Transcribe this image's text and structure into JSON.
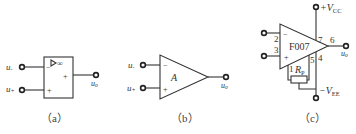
{
  "figure": {
    "panels": [
      {
        "id": "a",
        "caption": "（a）",
        "symbol": "rectangular-op-amp",
        "gain_mark": "▷∞",
        "inputs": [
          {
            "label": "u",
            "sub": "-",
            "sign": "−"
          },
          {
            "label": "u",
            "sub": "+",
            "sign": "+"
          }
        ],
        "output": {
          "label": "u",
          "sub": "o",
          "sign": "+"
        }
      },
      {
        "id": "b",
        "caption": "（b）",
        "symbol": "triangle-op-amp",
        "gain_label": "A",
        "inputs": [
          {
            "label": "u",
            "sub": "-",
            "sign": "−"
          },
          {
            "label": "u",
            "sub": "+",
            "sign": "+"
          }
        ],
        "output": {
          "label": "u",
          "sub": "o"
        }
      },
      {
        "id": "c",
        "caption": "（c）",
        "symbol": "triangle-op-amp-with-pins",
        "chip_name": "F007",
        "inputs": [
          {
            "pin": "2",
            "sign": "−"
          },
          {
            "pin": "3",
            "sign": "+"
          }
        ],
        "output": {
          "pin": "6",
          "label": "u",
          "sub": "o"
        },
        "supply_pos": {
          "pin": "7",
          "label": "+V",
          "sub": "CC"
        },
        "supply_neg": {
          "pin": "4",
          "label": "−V",
          "sub": "EE"
        },
        "offset_pins": [
          "1",
          "5"
        ],
        "potentiometer": {
          "label": "R",
          "sub": "P"
        }
      }
    ]
  }
}
